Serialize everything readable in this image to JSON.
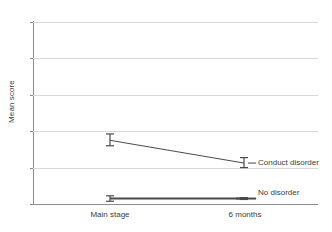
{
  "chart_data": {
    "type": "line",
    "title": "",
    "xlabel": "",
    "ylabel": "Mean score",
    "categories": [
      "Main stage",
      "6 months"
    ],
    "ylim": [
      0,
      10
    ],
    "yticks": [
      0,
      2,
      4,
      6,
      8,
      10
    ],
    "grid": true,
    "legend_position": "inline-right",
    "error_bars": true,
    "series": [
      {
        "name": "Conduct disorder",
        "values": [
          3.5,
          2.25
        ],
        "err_low": [
          3.2,
          2.0
        ],
        "err_high": [
          3.85,
          2.55
        ]
      },
      {
        "name": "No disorder",
        "values": [
          0.3,
          0.3
        ],
        "err_low": [
          0.15,
          0.25
        ],
        "err_high": [
          0.45,
          0.35
        ]
      }
    ]
  },
  "axis": {
    "y_title": "Mean score",
    "y_tick_labels": [
      "0",
      "2",
      "4",
      "6",
      "8",
      "10"
    ],
    "x_tick_labels": [
      "Main stage",
      "6 months"
    ]
  },
  "labels": {
    "conduct_disorder": "Conduct disorder",
    "no_disorder": "No disorder"
  },
  "colors": {
    "series_line": "#4a4a4a",
    "gridline": "#d8d8d8",
    "axis": "#8c8c8c",
    "text": "#3b3b3b",
    "background": "#ffffff"
  }
}
